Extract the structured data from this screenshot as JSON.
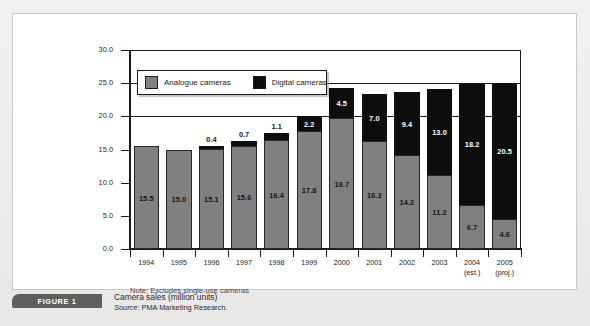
{
  "figure": {
    "tab_label": "FIGURE 1",
    "caption_title": "Camera sales (million units)",
    "source_prefix": "Source",
    "source_text": ": PMA Marketing Research."
  },
  "note": "Note: Excludes single-use cameras",
  "legend": {
    "items": [
      {
        "label": "Analogue cameras",
        "color": "#808080"
      },
      {
        "label": "Digital cameras",
        "color": "#0d0d0d"
      }
    ]
  },
  "colors": {
    "analogue": "#808080",
    "digital": "#0d0d0d",
    "axis": "#1b1b1b",
    "panel": "#ffffff",
    "page": "#eceaea",
    "figure_tab": "#5e5e5e"
  },
  "axis": {
    "y_ticks": [
      "0.0",
      "5.0",
      "10.0",
      "15.0",
      "20.0",
      "25.0",
      "30.0"
    ],
    "y_min": 0,
    "y_max": 30,
    "y_step": 5
  },
  "chart_data": {
    "type": "bar",
    "stacked": true,
    "title": "Camera sales (million units)",
    "xlabel": "",
    "ylabel": "",
    "ylim": [
      0,
      30
    ],
    "ytick_step": 5,
    "grid": true,
    "legend_position": "top-left-inside",
    "annotation": "Note: Excludes single-use cameras",
    "source": "PMA Marketing Research.",
    "categories": [
      "1994",
      "1995",
      "1996",
      "1997",
      "1998",
      "1999",
      "2000",
      "2001",
      "2002",
      "2003",
      "2004",
      "2005"
    ],
    "category_sublabels": [
      "",
      "",
      "",
      "",
      "",
      "",
      "",
      "",
      "",
      "",
      "(est.)",
      "(proj.)"
    ],
    "series": [
      {
        "name": "Analogue cameras",
        "color": "#808080",
        "values": [
          15.5,
          15.0,
          15.1,
          15.6,
          16.4,
          17.8,
          19.7,
          16.3,
          14.2,
          11.2,
          6.7,
          4.6
        ]
      },
      {
        "name": "Digital cameras",
        "color": "#0d0d0d",
        "values": [
          0,
          0,
          0.4,
          0.7,
          1.1,
          2.2,
          4.5,
          7.0,
          9.4,
          13.0,
          18.2,
          20.5
        ]
      }
    ],
    "totals": [
      15.5,
      15.0,
      15.5,
      16.3,
      17.5,
      20.0,
      24.2,
      23.3,
      23.6,
      24.2,
      24.9,
      25.1
    ]
  }
}
